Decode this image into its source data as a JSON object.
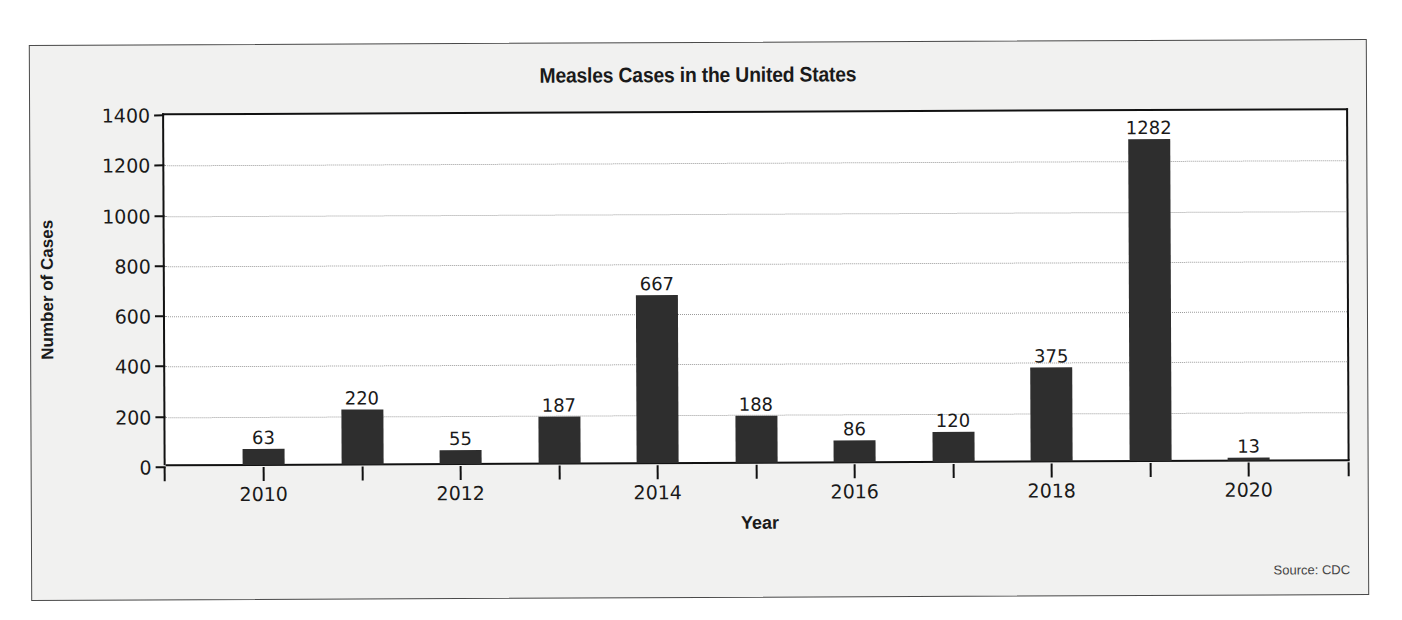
{
  "chart_data": {
    "type": "bar",
    "title": "Measles Cases in the United States",
    "xlabel": "Year",
    "ylabel": "Number of Cases",
    "source": "Source: CDC",
    "categories": [
      "2010",
      "2011",
      "2012",
      "2013",
      "2014",
      "2015",
      "2016",
      "2017",
      "2018",
      "2019",
      "2020"
    ],
    "values": [
      63,
      220,
      55,
      187,
      667,
      188,
      86,
      120,
      375,
      1282,
      13
    ],
    "x_tick_labels": [
      "2010",
      "2012",
      "2014",
      "2016",
      "2018",
      "2020"
    ],
    "y_ticks": [
      0,
      200,
      400,
      600,
      800,
      1000,
      1200,
      1400
    ],
    "ylim": [
      0,
      1400
    ],
    "grid": "horizontal dotted",
    "legend": null,
    "bar_color": "#2e2e2e",
    "data_labels": true
  }
}
